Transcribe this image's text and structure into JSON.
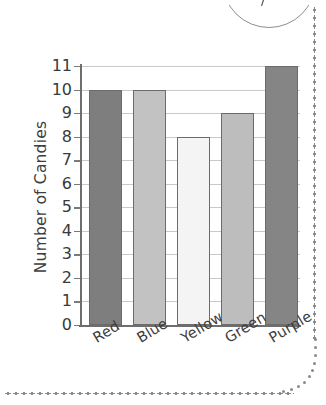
{
  "chart_data": {
    "type": "bar",
    "title": "",
    "xlabel": "",
    "ylabel": "Number of Candies",
    "categories": [
      "Red",
      "Blue",
      "Yellow",
      "Green",
      "Purple"
    ],
    "values": [
      10,
      10,
      8,
      9,
      11
    ],
    "ylim": [
      0,
      11
    ],
    "ytick_labels": [
      "11",
      "10",
      "9",
      "8",
      "7",
      "6",
      "5",
      "4",
      "3",
      "2",
      "1",
      "0"
    ],
    "ytick_values": [
      11,
      10,
      9,
      8,
      7,
      6,
      5,
      4,
      3,
      2,
      1,
      0
    ],
    "grid": true,
    "legend": "none",
    "bar_colors": [
      "#7e7e7e",
      "#c2c2c2",
      "#f4f4f4",
      "#bdbdbd",
      "#858585"
    ],
    "bar_border_color": "#6b6b6b",
    "axis_color": "#6e6e6e",
    "grid_color": "#c9c9c9",
    "text_color": "#3d3d3d"
  },
  "decoration": {
    "border_dot_color": "#8a8a8a",
    "arc_color": "#8e8e8e"
  }
}
